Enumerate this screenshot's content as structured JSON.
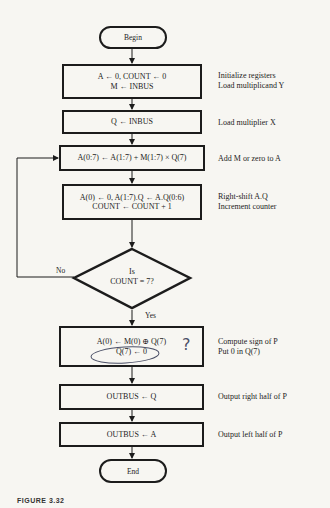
{
  "flowchart": {
    "begin": "Begin",
    "end": "End",
    "steps": [
      {
        "lines": [
          "A ← 0, COUNT ← 0",
          "M ← INBUS"
        ],
        "notes": [
          "Initialize registers",
          "Load multiplicand Y"
        ]
      },
      {
        "lines": [
          "Q ← INBUS"
        ],
        "notes": [
          "Load multiplier X"
        ]
      },
      {
        "lines": [
          "A(0:7) ← A(1:7) + M(1:7) × Q(7)"
        ],
        "notes": [
          "Add M or zero to A"
        ]
      },
      {
        "lines": [
          "A(0) ← 0, A(1:7).Q ← A.Q(0:6)",
          "COUNT ← COUNT + 1"
        ],
        "notes": [
          "Right-shift A.Q",
          "Increment counter"
        ]
      },
      {
        "lines": [
          "A(0) ← M(0) ⊕ Q(7)",
          "Q(7) ← 0"
        ],
        "notes": [
          "Compute sign of P",
          "Put 0 in Q(7)"
        ]
      },
      {
        "lines": [
          "OUTBUS ← Q"
        ],
        "notes": [
          "Output right half of P"
        ]
      },
      {
        "lines": [
          "OUTBUS ← A"
        ],
        "notes": [
          "Output left half of P"
        ]
      }
    ],
    "decision": {
      "lines": [
        "Is",
        "COUNT = 7?"
      ],
      "no_label": "No",
      "yes_label": "Yes"
    },
    "handwritten_mark": "?",
    "caption": "FIGURE 3.32"
  }
}
